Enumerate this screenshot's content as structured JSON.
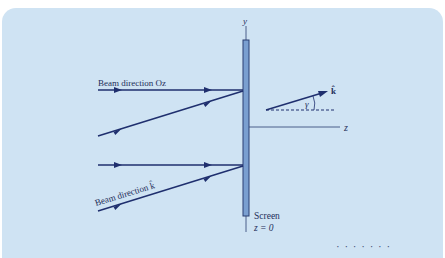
{
  "diagram": {
    "labels": {
      "y_axis": "y",
      "z_axis": "z",
      "beam_oz": "Beam direction Oz",
      "beam_k": "Beam direction k̂",
      "k_hat": "k̂",
      "gamma": "γ",
      "screen": "Screen",
      "screen_plane": "z = 0"
    },
    "colors": {
      "card_background": "#cfe3f3",
      "beam_line": "#1f2f6e",
      "screen_fill": "#7a9fd0",
      "screen_border": "#2a3f73",
      "axis_line": "#4a5f8a"
    },
    "footer_fragment": "· · ·   · · ·   ·"
  }
}
